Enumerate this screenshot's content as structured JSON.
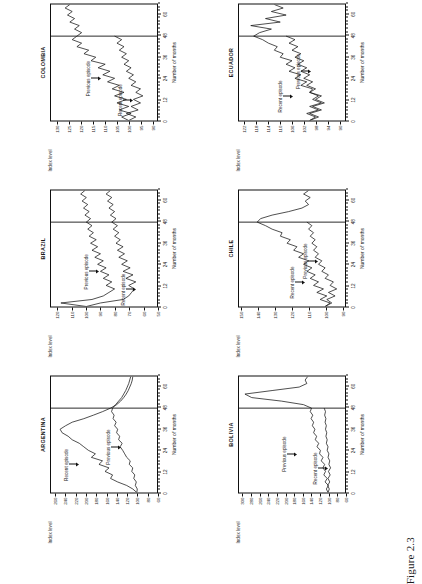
{
  "figure": {
    "caption": "Figure 2.3",
    "axis_y_title": "Index level",
    "axis_x_title": "Number of months",
    "annotation_recent": "Recent episode",
    "annotation_previous": "Previous episode",
    "line_color": "#111111",
    "frame_color": "#0f0f0f"
  },
  "chart_data": [
    {
      "type": "line",
      "title": "ARGENTINA",
      "xlabel": "Number of months",
      "ylabel": "Index level",
      "xlim": [
        0,
        66
      ],
      "ylim": [
        60,
        270
      ],
      "xticks": [
        0,
        12,
        24,
        36,
        48,
        60
      ],
      "yticks": [
        260,
        240,
        220,
        200,
        180,
        160,
        140,
        120,
        100,
        80,
        60
      ],
      "grid": false,
      "legend": "none",
      "divider_x": 48,
      "annotations": [
        {
          "text": "Recent episode",
          "x": 16,
          "y": 215
        },
        {
          "text": "Previous episode",
          "x": 26,
          "y": 133
        }
      ],
      "series": [
        {
          "name": "Recent episode",
          "x": [
            0,
            2,
            4,
            6,
            8,
            10,
            12,
            14,
            16,
            18,
            20,
            22,
            24,
            26,
            28,
            30,
            32,
            34,
            36,
            38,
            40,
            42,
            44,
            46,
            48,
            50,
            52,
            54,
            56,
            58,
            60,
            62,
            64,
            66
          ],
          "values": [
            100,
            108,
            120,
            138,
            152,
            148,
            163,
            155,
            175,
            168,
            190,
            182,
            196,
            205,
            214,
            228,
            236,
            248,
            252,
            241,
            228,
            205,
            186,
            168,
            152,
            140,
            132,
            126,
            121,
            117,
            114,
            111,
            109,
            108
          ]
        },
        {
          "name": "Previous episode",
          "x": [
            0,
            2,
            4,
            6,
            8,
            10,
            12,
            14,
            16,
            18,
            20,
            22,
            24,
            26,
            28,
            30,
            32,
            34,
            36,
            38,
            40,
            42,
            44,
            46,
            48,
            50,
            52,
            54,
            56,
            58,
            60,
            62,
            64,
            66
          ],
          "values": [
            100,
            99,
            103,
            101,
            106,
            104,
            110,
            108,
            115,
            113,
            120,
            124,
            128,
            133,
            129,
            136,
            134,
            140,
            138,
            144,
            141,
            147,
            145,
            150,
            148,
            142,
            136,
            130,
            126,
            122,
            119,
            116,
            114,
            112
          ]
        }
      ]
    },
    {
      "type": "line",
      "title": "BOLIVIA",
      "xlabel": "Number of months",
      "ylabel": "Index level",
      "xlim": [
        0,
        66
      ],
      "ylim": [
        60,
        310
      ],
      "xticks": [
        0,
        12,
        24,
        36,
        48,
        60
      ],
      "yticks": [
        300,
        280,
        260,
        240,
        220,
        200,
        180,
        160,
        140,
        120,
        100,
        80,
        60
      ],
      "grid": false,
      "legend": "none",
      "divider_x": 48,
      "annotations": [
        {
          "text": "Previous episode",
          "x": 22,
          "y": 175
        },
        {
          "text": "Recent episode",
          "x": 14,
          "y": 104
        }
      ],
      "series": [
        {
          "name": "Previous episode",
          "x": [
            0,
            2,
            4,
            6,
            8,
            10,
            12,
            14,
            16,
            18,
            20,
            22,
            24,
            26,
            28,
            30,
            32,
            34,
            36,
            38,
            40,
            42,
            44,
            46,
            48,
            50,
            52,
            54,
            56,
            58,
            60,
            62,
            64,
            66
          ],
          "values": [
            100,
            104,
            99,
            107,
            102,
            110,
            106,
            112,
            108,
            116,
            112,
            120,
            118,
            126,
            122,
            130,
            127,
            134,
            131,
            137,
            134,
            140,
            136,
            142,
            139,
            158,
            210,
            280,
            296,
            232,
            168,
            150,
            154,
            148
          ]
        },
        {
          "name": "Recent episode",
          "x": [
            0,
            2,
            4,
            6,
            8,
            10,
            12,
            14,
            16,
            18,
            20,
            22,
            24,
            26,
            28,
            30,
            32,
            34,
            36,
            38,
            40,
            42,
            44,
            46,
            48
          ],
          "values": [
            100,
            97,
            101,
            96,
            100,
            95,
            99,
            94,
            98,
            96,
            100,
            98,
            102,
            100,
            104,
            102,
            105,
            103,
            106,
            104,
            107,
            105,
            108,
            106,
            109
          ]
        }
      ]
    },
    {
      "type": "line",
      "title": "BRAZIL",
      "xlabel": "Number of months",
      "ylabel": "Index level",
      "xlim": [
        0,
        66
      ],
      "ylim": [
        50,
        125
      ],
      "xticks": [
        0,
        12,
        24,
        36,
        48,
        60
      ],
      "yticks": [
        120,
        110,
        100,
        90,
        80,
        70,
        60,
        50
      ],
      "grid": false,
      "legend": "none",
      "divider_x": 48,
      "annotations": [
        {
          "text": "Previous episode",
          "x": 20,
          "y": 92
        },
        {
          "text": "Recent episode",
          "x": 10,
          "y": 66
        }
      ],
      "series": [
        {
          "name": "Previous episode",
          "x": [
            0,
            2,
            4,
            6,
            8,
            10,
            12,
            14,
            16,
            18,
            20,
            22,
            24,
            26,
            28,
            30,
            32,
            34,
            36,
            38,
            40,
            42,
            44,
            46,
            48,
            50,
            52,
            54,
            56,
            58,
            60,
            62,
            64,
            66
          ],
          "values": [
            100,
            118,
            96,
            88,
            84,
            80,
            86,
            82,
            88,
            84,
            90,
            86,
            92,
            88,
            94,
            90,
            96,
            92,
            97,
            93,
            98,
            95,
            99,
            96,
            100,
            97,
            101,
            98,
            102,
            99,
            103,
            100,
            104,
            101
          ]
        },
        {
          "name": "Recent episode",
          "x": [
            0,
            2,
            4,
            6,
            8,
            10,
            12,
            14,
            16,
            18,
            20,
            22,
            24,
            26,
            28,
            30,
            32,
            34,
            36,
            38,
            40,
            42,
            44,
            46,
            48,
            50,
            52,
            54,
            56,
            58,
            60,
            62,
            64,
            66
          ],
          "values": [
            100,
            90,
            74,
            70,
            68,
            66,
            70,
            65,
            72,
            67,
            74,
            69,
            75,
            71,
            77,
            73,
            78,
            74,
            79,
            76,
            80,
            77,
            81,
            78,
            82,
            79,
            83,
            80,
            84,
            81,
            85,
            82,
            86,
            83
          ]
        }
      ]
    },
    {
      "type": "line",
      "title": "CHILE",
      "xlabel": "Number of months",
      "ylabel": "Index level",
      "xlim": [
        0,
        66
      ],
      "ylim": [
        88,
        152
      ],
      "xticks": [
        0,
        12,
        24,
        36,
        48,
        60
      ],
      "yticks": [
        150,
        140,
        130,
        120,
        110,
        100,
        90
      ],
      "grid": false,
      "legend": "none",
      "divider_x": 48,
      "annotations": [
        {
          "text": "Recent episode",
          "x": 14,
          "y": 113
        },
        {
          "text": "Previous episode",
          "x": 26,
          "y": 105
        }
      ],
      "series": [
        {
          "name": "Recent episode",
          "x": [
            0,
            2,
            4,
            6,
            8,
            10,
            12,
            14,
            16,
            18,
            20,
            22,
            24,
            26,
            28,
            30,
            32,
            34,
            36,
            38,
            40,
            42,
            44,
            46,
            48,
            50,
            52,
            54,
            56,
            58,
            60,
            62,
            64,
            66
          ],
          "values": [
            100,
            97,
            103,
            99,
            105,
            101,
            107,
            104,
            109,
            106,
            111,
            108,
            113,
            110,
            116,
            113,
            119,
            117,
            123,
            121,
            127,
            126,
            132,
            136,
            141,
            139,
            132,
            122,
            114,
            110,
            112,
            109,
            113,
            110
          ]
        },
        {
          "name": "Previous episode",
          "x": [
            0,
            2,
            4,
            6,
            8,
            10,
            12,
            14,
            16,
            18,
            20,
            22,
            24,
            26,
            28,
            30,
            32,
            34,
            36,
            38,
            40,
            42,
            44,
            46,
            48
          ],
          "values": [
            100,
            96,
            99,
            94,
            98,
            93,
            97,
            95,
            100,
            98,
            102,
            100,
            104,
            102,
            106,
            104,
            107,
            105,
            108,
            106,
            109,
            107,
            110,
            108,
            111
          ]
        }
      ]
    },
    {
      "type": "line",
      "title": "COLOMBIA",
      "xlabel": "Number of months",
      "ylabel": "Index level",
      "xlim": [
        0,
        66
      ],
      "ylim": [
        88,
        133
      ],
      "xticks": [
        0,
        12,
        24,
        36,
        48,
        60
      ],
      "yticks": [
        130,
        125,
        120,
        115,
        110,
        105,
        100,
        95,
        90
      ],
      "grid": false,
      "legend": "none",
      "divider_x": 48,
      "annotations": [
        {
          "text": "Previous episode",
          "x": 24,
          "y": 112
        },
        {
          "text": "Recent episode",
          "x": 12,
          "y": 99
        }
      ],
      "series": [
        {
          "name": "Previous episode",
          "x": [
            0,
            2,
            4,
            6,
            8,
            10,
            12,
            14,
            16,
            18,
            20,
            22,
            24,
            26,
            28,
            30,
            32,
            34,
            36,
            38,
            40,
            42,
            44,
            46,
            48,
            50,
            52,
            54,
            56,
            58,
            60,
            62,
            64,
            66
          ],
          "values": [
            100,
            103,
            99,
            104,
            100,
            105,
            101,
            106,
            102,
            107,
            104,
            109,
            106,
            111,
            108,
            113,
            110,
            116,
            114,
            119,
            117,
            122,
            120,
            124,
            122,
            120,
            123,
            121,
            125,
            123,
            126,
            124,
            127,
            125
          ]
        },
        {
          "name": "Recent episode",
          "x": [
            0,
            2,
            4,
            6,
            8,
            10,
            12,
            14,
            16,
            18,
            20,
            22,
            24,
            26,
            28,
            30,
            32,
            34,
            36,
            38,
            40,
            42,
            44,
            46,
            48
          ],
          "values": [
            100,
            97,
            101,
            96,
            99,
            95,
            98,
            94,
            97,
            95,
            99,
            97,
            100,
            98,
            101,
            99,
            102,
            100,
            103,
            101,
            104,
            102,
            105,
            103,
            106
          ]
        }
      ]
    },
    {
      "type": "line",
      "title": "ECUADOR",
      "xlabel": "Number of months",
      "ylabel": "Index level",
      "xlim": [
        0,
        66
      ],
      "ylim": [
        88,
        124
      ],
      "xticks": [
        0,
        12,
        24,
        36,
        48,
        60
      ],
      "yticks": [
        122,
        118,
        114,
        110,
        106,
        102,
        98,
        94,
        90
      ],
      "grid": false,
      "legend": "none",
      "divider_x": 48,
      "annotations": [
        {
          "text": "Recent episode",
          "x": 14,
          "y": 106
        },
        {
          "text": "Previous episode",
          "x": 28,
          "y": 100
        }
      ],
      "series": [
        {
          "name": "Recent episode",
          "x": [
            0,
            2,
            4,
            6,
            8,
            10,
            12,
            14,
            16,
            18,
            20,
            22,
            24,
            26,
            28,
            30,
            32,
            34,
            36,
            38,
            40,
            42,
            44,
            46,
            48,
            50,
            52,
            54,
            56,
            58,
            60,
            62,
            64,
            66
          ],
          "values": [
            100,
            97,
            100,
            96,
            99,
            95,
            98,
            96,
            100,
            99,
            103,
            101,
            105,
            103,
            107,
            105,
            108,
            106,
            110,
            109,
            112,
            111,
            114,
            116,
            119,
            117,
            113,
            120,
            110,
            115,
            108,
            113,
            109,
            112
          ]
        },
        {
          "name": "Previous episode",
          "x": [
            0,
            2,
            4,
            6,
            8,
            10,
            12,
            14,
            16,
            18,
            20,
            22,
            24,
            26,
            28,
            30,
            32,
            34,
            36,
            38,
            40,
            42,
            44,
            46,
            48
          ],
          "values": [
            100,
            98,
            101,
            97,
            100,
            96,
            99,
            97,
            100,
            98,
            101,
            99,
            102,
            100,
            103,
            101,
            104,
            102,
            105,
            103,
            106,
            104,
            107,
            105,
            108
          ]
        }
      ]
    }
  ]
}
